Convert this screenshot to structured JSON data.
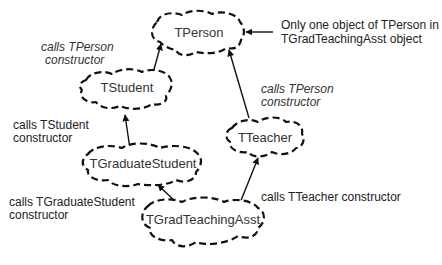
{
  "diagram": {
    "nodes": [
      {
        "id": "tperson",
        "label": "TPerson"
      },
      {
        "id": "tstudent",
        "label": "TStudent"
      },
      {
        "id": "tteacher",
        "label": "TTeacher"
      },
      {
        "id": "tgraduatestudent",
        "label": "TGraduateStudent"
      },
      {
        "id": "tgradteachingasst",
        "label": "TGradTeachingAsst"
      }
    ],
    "edges": [
      {
        "from": "tstudent",
        "to": "tperson"
      },
      {
        "from": "tteacher",
        "to": "tperson"
      },
      {
        "from": "tgraduatestudent",
        "to": "tstudent"
      },
      {
        "from": "tgradteachingasst",
        "to": "tgraduatestudent"
      },
      {
        "from": "tgradteachingasst",
        "to": "tteacher"
      }
    ],
    "annotations": {
      "tperson_note": {
        "line1": "Only one object of TPerson in",
        "line2": "TGradTeachingAsst  object"
      },
      "student_calls_person": {
        "line1": "calls TPerson",
        "line2": "constructor"
      },
      "teacher_calls_person": {
        "line1": "calls TPerson",
        "line2": "constructor"
      },
      "grad_calls_student": {
        "line1": "calls TStudent",
        "line2": "constructor"
      },
      "ta_calls_grad": {
        "line1": "calls TGraduateStudent",
        "line2": "constructor"
      },
      "ta_calls_teacher": {
        "line1": "calls TTeacher constructor"
      }
    }
  }
}
